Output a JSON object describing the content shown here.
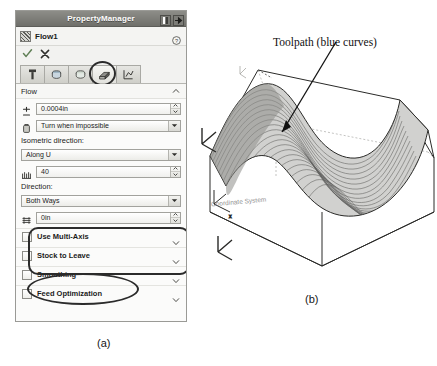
{
  "panel": {
    "title": "PropertyManager",
    "titlebar_icons": [
      "pin-icon",
      "arrow-right-icon"
    ],
    "feature_name": "Flow1",
    "feature_icon": "flow-feature-icon",
    "help_icon": "help-icon",
    "confirm_icon": "checkmark-icon",
    "cancel_icon": "cancel-x-icon",
    "tabs": [
      {
        "name": "tool-tab",
        "icon": "tool-icon",
        "selected": false
      },
      {
        "name": "stock-tab",
        "icon": "stock-icon",
        "selected": false
      },
      {
        "name": "part-tab",
        "icon": "part-icon",
        "selected": false
      },
      {
        "name": "toolpath-tab",
        "icon": "toolpath-icon",
        "selected": true
      },
      {
        "name": "links-tab",
        "icon": "links-icon",
        "selected": false
      }
    ],
    "sections": {
      "flow": {
        "header": "Flow",
        "tolerance": {
          "icon": "tolerance-icon",
          "value": "0.0004in"
        },
        "turn_mode": {
          "icon": "turn-icon",
          "value": "Turn when impossible"
        }
      },
      "isometric": {
        "label": "Isometric direction:",
        "direction": "Along U",
        "stepover": "40",
        "stepover_icon": "stepover-icon"
      },
      "direction": {
        "label": "Direction:",
        "value": "Both Ways",
        "offset": "0in",
        "offset_icon": "offset-icon"
      }
    },
    "collapsed": [
      {
        "label": "Use Multi-Axis",
        "checked": false
      },
      {
        "label": "Stock to Leave",
        "checked": false
      },
      {
        "label": "Smoothing",
        "checked": false
      },
      {
        "label": "Feed Optimization",
        "checked": false
      }
    ]
  },
  "figure": {
    "toolpath_label": "Toolpath (blue curves)",
    "coordinate_system_label": "Coordinate System",
    "caption_a": "(a)",
    "caption_b": "(b)"
  },
  "colors": {
    "titlebar": "#6f6f6a",
    "panel_bg": "#f2f2f0",
    "annotation": "#2b2b2b",
    "confirm": "#5f7f55"
  }
}
